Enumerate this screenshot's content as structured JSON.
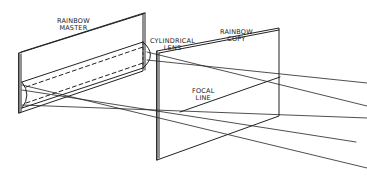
{
  "diagram": {
    "type": "optical-setup-line-drawing",
    "labels": {
      "master": [
        "RAINBOW",
        "MASTER"
      ],
      "lens": [
        "CYLINDRICAL",
        "LENS"
      ],
      "copy": [
        "RAINBOW",
        "COPY"
      ],
      "focal": [
        "FOCAL",
        "LINE"
      ]
    },
    "colors": {
      "stroke": "#222222",
      "background": "#ffffff"
    }
  }
}
